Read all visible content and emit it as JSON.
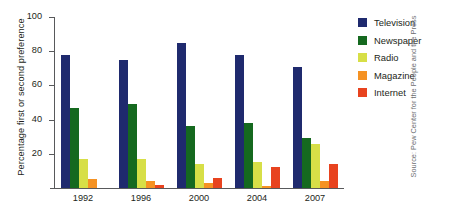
{
  "chart_data": {
    "type": "bar",
    "title": "",
    "xlabel": "",
    "ylabel": "Percentage first or second preference",
    "categories": [
      "1992",
      "1996",
      "2000",
      "2004",
      "2007"
    ],
    "ylim": [
      0,
      100
    ],
    "yticks": [
      0,
      20,
      40,
      60,
      80,
      100
    ],
    "ytick_labels": [
      "",
      "20",
      "40",
      "60",
      "80",
      "100"
    ],
    "grid": false,
    "legend_position": "right",
    "series": [
      {
        "name": "Television",
        "color": "#1f2a6e",
        "values": [
          78,
          75,
          85,
          78,
          71
        ]
      },
      {
        "name": "Newspaper",
        "color": "#15691f",
        "values": [
          47,
          49,
          36,
          38,
          29
        ]
      },
      {
        "name": "Radio",
        "color": "#d7df47",
        "values": [
          17,
          17,
          14,
          15,
          26
        ]
      },
      {
        "name": "Magazine",
        "color": "#f59223",
        "values": [
          5,
          4,
          3,
          1,
          4
        ]
      },
      {
        "name": "Internet",
        "color": "#e8431f",
        "values": [
          0,
          2,
          6,
          12,
          14
        ]
      }
    ]
  },
  "source": {
    "text": "Source: Pew Center for the People and the Press"
  }
}
